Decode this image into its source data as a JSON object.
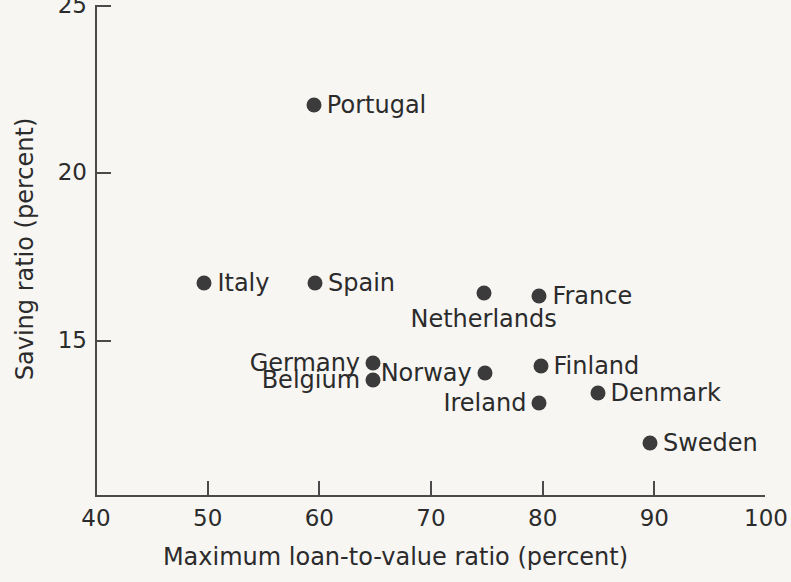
{
  "chart_data": {
    "type": "scatter",
    "title": "",
    "xlabel": "Maximum loan-to-value ratio (percent)",
    "ylabel": "Saving ratio (percent)",
    "xlim": [
      40,
      100
    ],
    "ylim": [
      10.3,
      25
    ],
    "xticks": [
      40,
      50,
      60,
      70,
      80,
      90,
      100
    ],
    "yticks": [
      15,
      20,
      25
    ],
    "grid": false,
    "legend": "none",
    "marker_color": "#3b3b3b",
    "background_color": "#f7f6f3",
    "axis_color": "#4a4a4a",
    "points": [
      {
        "label": "Portugal",
        "x": 59.6,
        "y": 22.0,
        "label_pos": "right"
      },
      {
        "label": "Italy",
        "x": 49.8,
        "y": 16.7,
        "label_pos": "right"
      },
      {
        "label": "Spain",
        "x": 59.7,
        "y": 16.7,
        "label_pos": "right"
      },
      {
        "label": "Netherlands",
        "x": 74.8,
        "y": 16.4,
        "label_pos": "below"
      },
      {
        "label": "France",
        "x": 79.8,
        "y": 16.3,
        "label_pos": "right"
      },
      {
        "label": "Germany",
        "x": 64.9,
        "y": 14.3,
        "label_pos": "left"
      },
      {
        "label": "Belgium",
        "x": 64.9,
        "y": 13.8,
        "label_pos": "left"
      },
      {
        "label": "Norway",
        "x": 74.9,
        "y": 14.0,
        "label_pos": "left"
      },
      {
        "label": "Finland",
        "x": 79.9,
        "y": 14.2,
        "label_pos": "right"
      },
      {
        "label": "Ireland",
        "x": 79.8,
        "y": 13.1,
        "label_pos": "left"
      },
      {
        "label": "Denmark",
        "x": 85.0,
        "y": 13.4,
        "label_pos": "right"
      },
      {
        "label": "Sweden",
        "x": 89.7,
        "y": 11.9,
        "label_pos": "right"
      }
    ]
  }
}
